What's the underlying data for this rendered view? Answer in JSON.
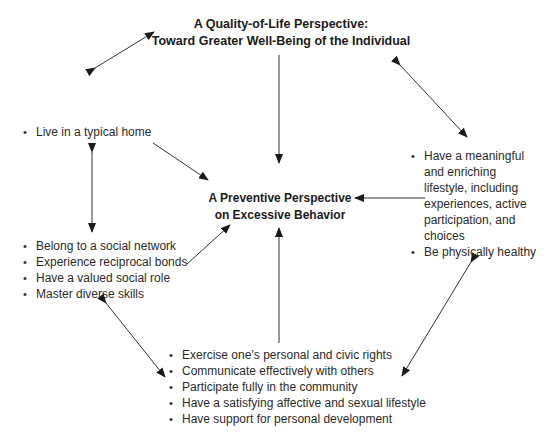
{
  "diagram": {
    "top_node": {
      "lines": [
        "A Quality-of-Life Perspective:",
        "Toward Greater Well-Being of the Individual"
      ]
    },
    "center_node": {
      "lines": [
        "A Preventive Perspective",
        "on Excessive Behavior"
      ]
    },
    "left_top_node": {
      "items": [
        "Live in a typical home"
      ]
    },
    "left_bottom_node": {
      "items": [
        "Belong to a social network",
        "Experience reciprocal bonds",
        "Have a valued social role",
        "Master diverse skills"
      ]
    },
    "right_node": {
      "items": [
        "Have a meaningful and enriching lifestyle, including experiences, active participation, and choices",
        "Be physically healthy"
      ]
    },
    "bottom_node": {
      "items": [
        "Exercise one’s personal and civic rights",
        "Communicate effectively with others",
        "Participate fully in the community",
        "Have a satisfying affective and sexual lifestyle",
        "Have support for personal development"
      ]
    },
    "arrow_color": "#1a1a1a"
  }
}
